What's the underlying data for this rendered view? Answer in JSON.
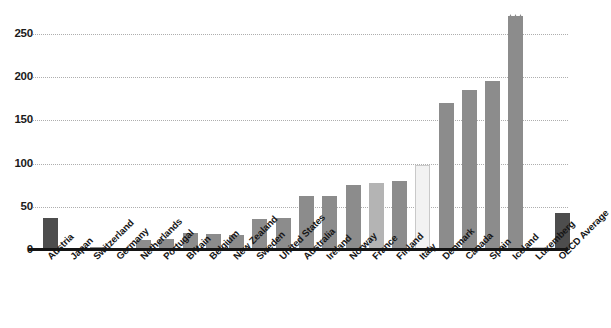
{
  "chart_data": {
    "type": "bar",
    "title": "",
    "subtitle": "",
    "xlabel": "",
    "ylabel": "",
    "ylim": [
      0,
      280
    ],
    "yticks": [
      0,
      50,
      100,
      150,
      200,
      250
    ],
    "grid": true,
    "legend": "none",
    "categories": [
      "Austria",
      "Japan",
      "Switzerland",
      "Germany",
      "Netherlands",
      "Portugal",
      "Britain",
      "Belgium",
      "New Zealand",
      "Sweden",
      "United States",
      "Australia",
      "Ireland",
      "Norway",
      "France",
      "Finland",
      "Italy",
      "Denmark",
      "Canada",
      "Spain",
      "Iceland",
      "Luxemberg",
      "OECD Average"
    ],
    "values": [
      37,
      2,
      3,
      2,
      12,
      13,
      20,
      19,
      17,
      36,
      37,
      63,
      62,
      75,
      78,
      80,
      98,
      170,
      185,
      195,
      581,
      3,
      43
    ],
    "annotations": [
      {
        "category": "Iceland",
        "text": "581",
        "note": "broken-axis value flag above truncated bar"
      }
    ],
    "bar_styles": [
      "dark",
      "mid",
      "mid",
      "mid",
      "mid",
      "mid",
      "mid",
      "mid",
      "mid",
      "mid",
      "mid",
      "mid",
      "mid",
      "mid",
      "light",
      "mid",
      "pale",
      "mid",
      "mid",
      "mid",
      "mid",
      "pale",
      "dark"
    ],
    "colors": {
      "bar_dark": "#4d4d4d",
      "bar_mid": "#8c8c8c",
      "bar_light": "#b4b4b4",
      "bar_pale": "#f2f2f2",
      "axis": "#141414",
      "grid": "#aeaeae",
      "text": "#161616",
      "background": "#ffffff"
    },
    "clipped_bar": {
      "category": "Iceland",
      "displayed_top_value": 275,
      "actual_value": 581
    }
  }
}
